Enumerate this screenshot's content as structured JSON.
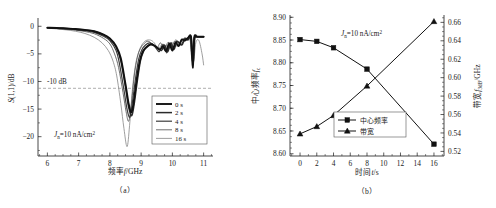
{
  "figure": {
    "panels": [
      "(a)",
      "(b)"
    ]
  },
  "chart_data": [
    {
      "id": "panel-a",
      "type": "line",
      "title": "",
      "caption": "（a）",
      "xlabel": "频率f/GHz",
      "ylabel": "S(1,1)/dB",
      "xlim": [
        5.7,
        11.3
      ],
      "ylim": [
        -23.5,
        1.5
      ],
      "xticks": [
        6,
        7,
        8,
        9,
        10,
        11
      ],
      "yticks": [
        0,
        -5,
        -10,
        -15,
        -20
      ],
      "xticklabels": [
        "6",
        "7",
        "8",
        "9",
        "10",
        "11"
      ],
      "yticklabels": [
        "0",
        "-5",
        "-10",
        "-15",
        "-20"
      ],
      "grid": false,
      "annotations": [
        {
          "name": "current-density",
          "text": "J",
          "sub": "n",
          "rest": "=10 nA/cm",
          "sup": "2"
        },
        {
          "name": "reference-level",
          "text": "-10 dB"
        }
      ],
      "reference_lines": [
        {
          "y": -10,
          "label": "-10 dB",
          "style": "dashed"
        }
      ],
      "legend": {
        "position": "lower-right",
        "entries": [
          {
            "label": "0 s",
            "color": "#111111",
            "width": 1.9
          },
          {
            "label": "2 s",
            "color": "#2b2b2b",
            "width": 1.5
          },
          {
            "label": "4 s",
            "color": "#3d3d3d",
            "width": 1.2
          },
          {
            "label": "8 s",
            "color": "#606060",
            "width": 0.9
          },
          {
            "label": "16 s",
            "color": "#858585",
            "width": 0.8
          }
        ]
      },
      "series": [
        {
          "name": "0 s",
          "color": "#111111",
          "x": [
            6.0,
            6.3,
            6.6,
            6.9,
            7.2,
            7.5,
            7.8,
            8.0,
            8.2,
            8.35,
            8.5,
            8.6,
            8.68,
            8.75,
            8.85,
            8.95,
            9.05,
            9.15,
            9.3,
            9.45,
            9.6,
            9.7,
            9.8,
            9.9,
            10.0,
            10.1,
            10.2,
            10.3,
            10.4,
            10.5,
            10.6,
            10.65,
            10.7,
            10.75,
            10.8,
            10.9,
            11.0
          ],
          "y": [
            -0.25,
            -0.3,
            -0.4,
            -0.5,
            -0.65,
            -0.9,
            -1.5,
            -2.2,
            -3.6,
            -5.8,
            -10.5,
            -14.0,
            -15.6,
            -14.2,
            -10.0,
            -6.5,
            -4.6,
            -3.9,
            -3.3,
            -3.6,
            -4.2,
            -3.6,
            -4.5,
            -3.1,
            -4.4,
            -2.9,
            -3.6,
            -2.4,
            -2.6,
            -2.1,
            -2.0,
            -7.5,
            -2.1,
            -1.9,
            -1.9,
            -1.9,
            -1.9
          ]
        },
        {
          "name": "2 s",
          "color": "#2b2b2b",
          "x": [
            6.0,
            6.3,
            6.6,
            6.9,
            7.2,
            7.5,
            7.8,
            8.0,
            8.2,
            8.35,
            8.5,
            8.6,
            8.7,
            8.78,
            8.88,
            8.98,
            9.08,
            9.2,
            9.35,
            9.5,
            9.65,
            9.75,
            9.85,
            9.95,
            10.05,
            10.15,
            10.3,
            10.4,
            10.5,
            10.6,
            10.66,
            10.72,
            10.8,
            10.9,
            11.0
          ],
          "y": [
            -0.25,
            -0.32,
            -0.42,
            -0.55,
            -0.7,
            -0.95,
            -1.55,
            -2.3,
            -3.8,
            -6.2,
            -11.0,
            -14.6,
            -16.2,
            -14.0,
            -9.8,
            -6.2,
            -4.5,
            -3.6,
            -3.2,
            -3.8,
            -4.4,
            -3.4,
            -4.6,
            -3.0,
            -4.2,
            -2.8,
            -3.4,
            -2.3,
            -2.5,
            -2.0,
            -7.0,
            -2.0,
            -1.9,
            -1.9,
            -1.9
          ]
        },
        {
          "name": "4 s",
          "color": "#3d3d3d",
          "x": [
            6.0,
            6.3,
            6.6,
            6.9,
            7.2,
            7.5,
            7.8,
            8.0,
            8.2,
            8.3,
            8.45,
            8.55,
            8.64,
            8.72,
            8.82,
            8.92,
            9.02,
            9.14,
            9.28,
            9.42,
            9.58,
            9.7,
            9.82,
            9.92,
            10.02,
            10.14,
            10.28,
            10.4,
            10.5,
            10.58,
            10.64,
            10.7,
            10.8,
            10.9,
            11.0
          ],
          "y": [
            -0.28,
            -0.35,
            -0.45,
            -0.6,
            -0.8,
            -1.1,
            -1.8,
            -2.6,
            -4.4,
            -6.6,
            -11.5,
            -15.0,
            -16.5,
            -13.8,
            -9.5,
            -6.0,
            -4.3,
            -3.4,
            -3.0,
            -3.5,
            -4.6,
            -3.3,
            -4.8,
            -3.2,
            -4.0,
            -2.7,
            -3.3,
            -2.2,
            -2.4,
            -2.0,
            -6.4,
            -2.0,
            -1.9,
            -1.9,
            -1.9
          ]
        },
        {
          "name": "8 s",
          "color": "#606060",
          "x": [
            6.0,
            6.3,
            6.6,
            6.9,
            7.2,
            7.5,
            7.8,
            8.0,
            8.15,
            8.28,
            8.42,
            8.52,
            8.6,
            8.68,
            8.78,
            8.88,
            8.98,
            9.1,
            9.22,
            9.35,
            9.5,
            9.62,
            9.74,
            9.86,
            9.98,
            10.1,
            10.25,
            10.38,
            10.48,
            10.56,
            10.62,
            10.7,
            10.8,
            10.9,
            11.0
          ],
          "y": [
            -0.3,
            -0.4,
            -0.52,
            -0.7,
            -0.95,
            -1.35,
            -2.2,
            -3.2,
            -5.0,
            -7.5,
            -12.0,
            -15.5,
            -17.2,
            -14.5,
            -9.0,
            -5.6,
            -4.0,
            -3.1,
            -2.7,
            -3.2,
            -4.0,
            -3.0,
            -4.2,
            -2.9,
            -3.5,
            -2.5,
            -3.0,
            -2.1,
            -2.3,
            -1.95,
            -5.5,
            -1.95,
            -1.9,
            -1.9,
            -1.9
          ]
        },
        {
          "name": "16 s",
          "color": "#858585",
          "x": [
            6.0,
            6.3,
            6.6,
            6.9,
            7.2,
            7.5,
            7.75,
            7.95,
            8.1,
            8.22,
            8.35,
            8.45,
            8.55,
            8.63,
            8.72,
            8.82,
            8.92,
            9.02,
            9.15,
            9.3,
            9.42,
            9.55,
            9.7,
            9.85,
            10.0,
            10.15,
            10.3,
            10.45,
            10.55,
            10.62,
            10.68,
            10.75,
            10.85,
            10.95,
            11.0
          ],
          "y": [
            -0.35,
            -0.48,
            -0.65,
            -0.9,
            -1.3,
            -2.0,
            -3.0,
            -4.4,
            -6.3,
            -9.0,
            -14.0,
            -18.5,
            -21.8,
            -18.0,
            -11.5,
            -7.0,
            -4.7,
            -3.4,
            -2.6,
            -2.5,
            -3.0,
            -4.0,
            -3.2,
            -4.3,
            -3.0,
            -3.6,
            -2.4,
            -2.5,
            -2.0,
            -4.5,
            -6.5,
            -3.0,
            -2.6,
            -5.0,
            -7.0
          ]
        }
      ]
    },
    {
      "id": "panel-b",
      "type": "line",
      "title": "",
      "caption": "（b）",
      "xlabel": "时间t/s",
      "ylabel_left": "中心频率f",
      "ylabel_left_sub": "c",
      "ylabel_right": "带宽f",
      "ylabel_right_sub": "3dB",
      "ylabel_right_unit": "/GHz",
      "xlim": [
        -1.2,
        17.2
      ],
      "ylim_left": [
        8.595,
        8.905
      ],
      "ylim_right": [
        0.515,
        0.668
      ],
      "xticks": [
        0,
        2,
        4,
        6,
        8,
        10,
        12,
        14,
        16
      ],
      "xticklabels": [
        "0",
        "2",
        "4",
        "6",
        "8",
        "10",
        "12",
        "14",
        "16"
      ],
      "yticks_left": [
        8.6,
        8.65,
        8.7,
        8.75,
        8.8,
        8.85,
        8.9
      ],
      "yticklabels_left": [
        "8.60",
        "8.65",
        "8.70",
        "8.75",
        "8.80",
        "8.85",
        "8.90"
      ],
      "yticks_right": [
        0.52,
        0.54,
        0.56,
        0.58,
        0.6,
        0.62,
        0.64,
        0.66
      ],
      "yticklabels_right": [
        "0.52",
        "0.54",
        "0.56",
        "0.58",
        "0.60",
        "0.62",
        "0.64",
        "0.66"
      ],
      "grid": false,
      "annotations": [
        {
          "name": "current-density",
          "text": "J",
          "sub": "n",
          "rest": "=10 nA/cm",
          "sup": "2"
        }
      ],
      "legend": {
        "position": "lower-center",
        "entries": [
          {
            "label": "中心频率",
            "marker": "square"
          },
          {
            "label": "带宽",
            "marker": "triangle"
          }
        ]
      },
      "x": [
        0,
        2,
        4,
        8,
        16
      ],
      "series": [
        {
          "name": "中心频率",
          "axis": "left",
          "marker": "square",
          "values": [
            8.851,
            8.847,
            8.833,
            8.786,
            8.621
          ]
        },
        {
          "name": "带宽",
          "axis": "right",
          "marker": "triangle",
          "values": [
            0.539,
            0.547,
            0.559,
            0.591,
            0.661
          ]
        }
      ]
    }
  ]
}
